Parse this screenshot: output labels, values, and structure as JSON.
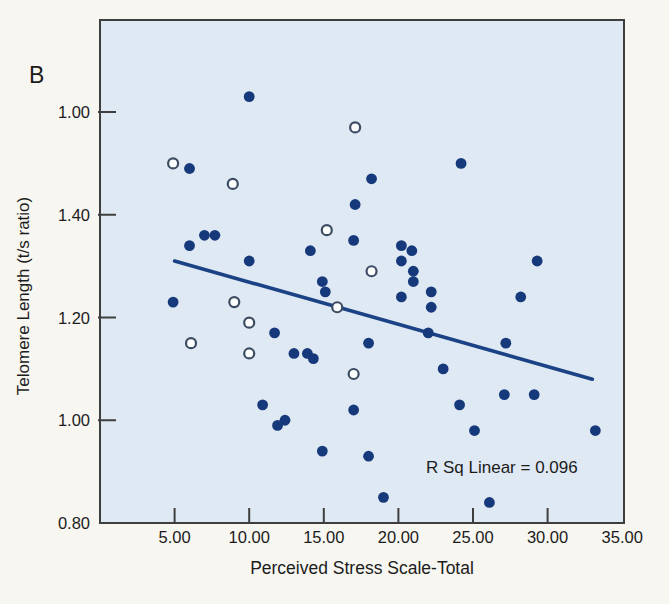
{
  "panel_label": "B",
  "axes": {
    "y": {
      "title": "Telomere Length (t/s ratio)",
      "ticks": [
        {
          "label": "1.00",
          "value": 1.6
        },
        {
          "label": "1.40",
          "value": 1.4
        },
        {
          "label": "1.20",
          "value": 1.2
        },
        {
          "label": "1.00",
          "value": 1.0
        },
        {
          "label": "0.80",
          "value": 0.8
        }
      ]
    },
    "x": {
      "title": "Perceived Stress Scale-Total",
      "ticks": [
        {
          "label": "5.00",
          "value": 5
        },
        {
          "label": "10.00",
          "value": 10
        },
        {
          "label": "15.00",
          "value": 15
        },
        {
          "label": "20.00",
          "value": 20
        },
        {
          "label": "25.00",
          "value": 25
        },
        {
          "label": "30.00",
          "value": 30
        },
        {
          "label": "35.00",
          "value": 35
        }
      ]
    }
  },
  "chart_data": {
    "type": "scatter",
    "title": "",
    "xlabel": "Perceived Stress Scale-Total",
    "ylabel": "Telomere Length (t/s ratio)",
    "xlim": [
      0,
      35.2
    ],
    "ylim": [
      0.8,
      1.78
    ],
    "grid": false,
    "annotation": "R Sq Linear = 0.096",
    "r_squared": 0.096,
    "regression_line": {
      "x_start": 5.0,
      "y_start": 1.31,
      "x_end": 33.0,
      "y_end": 1.08
    },
    "series": [
      {
        "name": "filled-circles",
        "marker": "filled-circle",
        "points": [
          [
            10.0,
            1.63
          ],
          [
            6.0,
            1.49
          ],
          [
            24.2,
            1.5
          ],
          [
            18.2,
            1.47
          ],
          [
            17.1,
            1.42
          ],
          [
            7.0,
            1.36
          ],
          [
            7.7,
            1.36
          ],
          [
            6.0,
            1.34
          ],
          [
            17.0,
            1.35
          ],
          [
            20.2,
            1.34
          ],
          [
            14.1,
            1.33
          ],
          [
            20.9,
            1.33
          ],
          [
            10.0,
            1.31
          ],
          [
            20.2,
            1.31
          ],
          [
            29.3,
            1.31
          ],
          [
            21.0,
            1.29
          ],
          [
            14.9,
            1.27
          ],
          [
            21.0,
            1.27
          ],
          [
            15.1,
            1.25
          ],
          [
            22.2,
            1.25
          ],
          [
            20.2,
            1.24
          ],
          [
            28.2,
            1.24
          ],
          [
            4.9,
            1.23
          ],
          [
            22.2,
            1.22
          ],
          [
            11.7,
            1.17
          ],
          [
            22.0,
            1.17
          ],
          [
            27.2,
            1.15
          ],
          [
            18.0,
            1.15
          ],
          [
            13.0,
            1.13
          ],
          [
            13.9,
            1.13
          ],
          [
            14.3,
            1.12
          ],
          [
            23.0,
            1.1
          ],
          [
            27.1,
            1.05
          ],
          [
            29.1,
            1.05
          ],
          [
            10.9,
            1.03
          ],
          [
            24.1,
            1.03
          ],
          [
            17.0,
            1.02
          ],
          [
            12.4,
            1.0
          ],
          [
            11.9,
            0.99
          ],
          [
            25.1,
            0.98
          ],
          [
            33.2,
            0.98
          ],
          [
            14.9,
            0.94
          ],
          [
            18.0,
            0.93
          ],
          [
            19.0,
            0.85
          ],
          [
            26.1,
            0.84
          ]
        ]
      },
      {
        "name": "open-circles",
        "marker": "open-circle",
        "points": [
          [
            17.1,
            1.57
          ],
          [
            4.9,
            1.5
          ],
          [
            8.9,
            1.46
          ],
          [
            15.2,
            1.37
          ],
          [
            18.2,
            1.29
          ],
          [
            9.0,
            1.23
          ],
          [
            15.9,
            1.22
          ],
          [
            10.0,
            1.19
          ],
          [
            6.1,
            1.15
          ],
          [
            10.0,
            1.13
          ],
          [
            17.0,
            1.09
          ]
        ]
      }
    ]
  },
  "colors": {
    "page_bg": "#f7f6f1",
    "plot_bg": "#dfe9f3",
    "dot": "#16397b",
    "line": "#1a4284",
    "open_fill": "#fdfefe",
    "open_stroke": "#3c4c63",
    "axis": "#3e3e3e",
    "text": "#1c1c1c"
  }
}
